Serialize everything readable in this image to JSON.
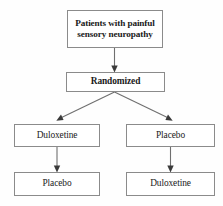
{
  "diagram": {
    "background_color": "#fefefe",
    "box_border_color": "#8b8b8b",
    "connector_color": "#6f6f6f",
    "text_color": "#1a1a1a",
    "nodes": [
      {
        "id": "population",
        "label": "Patients with painful\nsensory neuropathy",
        "level": "enrollment"
      },
      {
        "id": "randomized",
        "label": "Randomized",
        "level": "allocation"
      },
      {
        "id": "arm_a_period1",
        "label": "Duloxetine",
        "level": "period-1",
        "side": "left"
      },
      {
        "id": "arm_b_period1",
        "label": "Placebo",
        "level": "period-1",
        "side": "right"
      },
      {
        "id": "arm_a_period2",
        "label": "Placebo",
        "level": "period-2",
        "side": "left"
      },
      {
        "id": "arm_b_period2",
        "label": "Duloxetine",
        "level": "period-2",
        "side": "right"
      }
    ],
    "edges": [
      {
        "from": "population",
        "to": "randomized",
        "style": "vertical-arrow"
      },
      {
        "from": "randomized",
        "to": "arm_a_period1",
        "style": "diagonal-arrow"
      },
      {
        "from": "randomized",
        "to": "arm_b_period1",
        "style": "diagonal-arrow"
      },
      {
        "from": "arm_a_period1",
        "to": "arm_a_period2",
        "style": "vertical-arrow"
      },
      {
        "from": "arm_b_period1",
        "to": "arm_b_period2",
        "style": "vertical-arrow"
      }
    ]
  }
}
